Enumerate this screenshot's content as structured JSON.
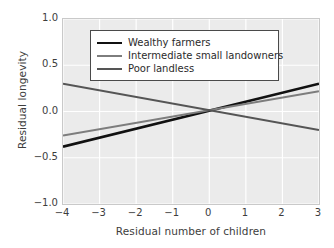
{
  "chart_data": {
    "type": "line",
    "title": "",
    "xlabel": "Residual number of children",
    "ylabel": "Residual longevity",
    "xlim": [
      -4,
      3
    ],
    "ylim": [
      -1.0,
      1.0
    ],
    "xticks": [
      "−4",
      "−3",
      "−2",
      "−1",
      "0",
      "1",
      "2",
      "3"
    ],
    "xtick_values": [
      -4,
      -3,
      -2,
      -1,
      0,
      1,
      2,
      3
    ],
    "yticks": [
      "1.0",
      "0.5",
      "0.0",
      "−0.5",
      "−1.0"
    ],
    "ytick_values": [
      1.0,
      0.5,
      0.0,
      -0.5,
      -1.0
    ],
    "grid": true,
    "legend_position": "upper center",
    "series": [
      {
        "name": "Wealthy farmers",
        "color": "#111111",
        "width": 2.6,
        "x": [
          -4,
          3
        ],
        "y": [
          -0.38,
          0.3
        ]
      },
      {
        "name": "Intermediate small landowners",
        "color": "#7d7d7d",
        "width": 2.0,
        "x": [
          -4,
          3
        ],
        "y": [
          -0.26,
          0.22
        ]
      },
      {
        "name": "Poor landless",
        "color": "#555555",
        "width": 2.0,
        "x": [
          -4,
          3
        ],
        "y": [
          0.3,
          -0.2
        ]
      }
    ]
  },
  "figure": {
    "background": "#ffffff",
    "plot_background": "#ebebeb",
    "gridline_color": "#ffffff",
    "axis_color": "#c9c9c9",
    "text_color": "#3d3d3d"
  }
}
